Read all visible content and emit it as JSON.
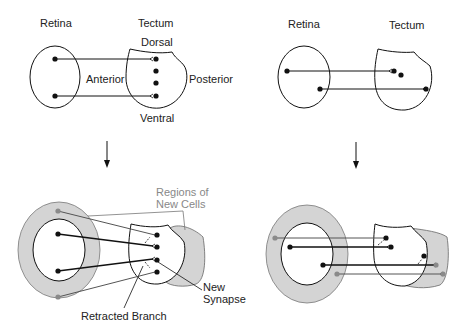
{
  "panels": {
    "top_left": {
      "retina_label": "Retina",
      "tectum_label": "Tectum",
      "dorsal_label": "Dorsal",
      "ventral_label": "Ventral",
      "anterior_label": "Anterior",
      "posterior_label": "Posterior"
    },
    "top_right": {
      "retina_label": "Retina",
      "tectum_label": "Tectum"
    },
    "bottom_left": {
      "regions_label_line1": "Regions of",
      "regions_label_line2": "New Cells",
      "new_synapse_line1": "New",
      "new_synapse_line2": "Synapse",
      "retracted_label": "Retracted Branch"
    },
    "bottom_right": {}
  },
  "colors": {
    "ink": "#111111",
    "new_region_fill": "#d4d4d4",
    "new_cell_dot": "#8a8a8a",
    "gray_label": "#888888"
  }
}
